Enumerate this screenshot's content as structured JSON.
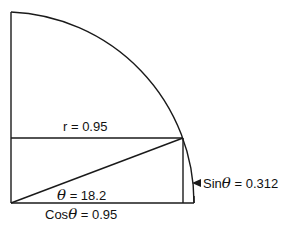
{
  "diagram": {
    "type": "unit-circle-quadrant",
    "stroke_color": "#1a1a1a",
    "labels": {
      "radius": "r = 0.95",
      "theta_symbol": "θ",
      "theta_value": "= 18.2",
      "cos_prefix": "Cos",
      "cos_value": "= 0.95",
      "sin_prefix": "Sin",
      "sin_value": "= 0.312"
    }
  }
}
